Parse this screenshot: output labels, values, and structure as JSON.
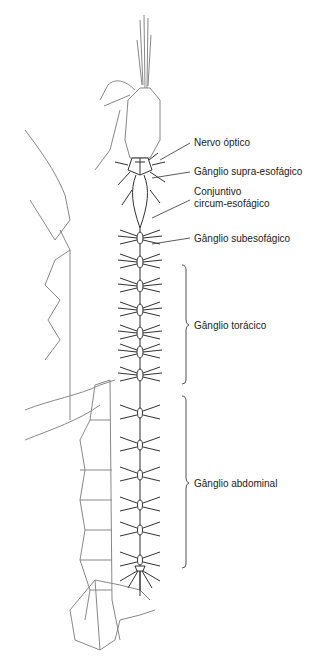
{
  "diagram": {
    "labels": {
      "nervo_optico": "Nervo óptico",
      "ganglio_supra": "Gânglio supra-esofágico",
      "conjuntivo_1": "Conjuntivo",
      "conjuntivo_2": "circum-esofágico",
      "ganglio_sub": "Gânglio subesofágico",
      "ganglio_toracico": "Gânglio torácico",
      "ganglio_abdominal": "Gânglio abdominal"
    },
    "colors": {
      "line": "#333333",
      "body": "#888888",
      "text": "#222222"
    }
  }
}
